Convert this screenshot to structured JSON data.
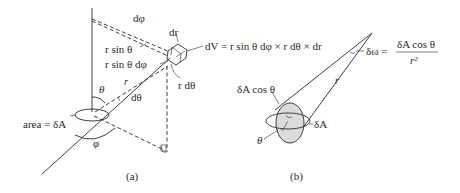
{
  "figure": {
    "panel_a": {
      "caption": "(a)",
      "labels": {
        "d_phi": "dφ",
        "dr": "dr",
        "r_sin_theta": "r sin θ",
        "r_sin_theta_dphi": "r sin θ dφ",
        "dV_formula": "dV = r sin θ dφ × r dθ × dr",
        "r_dtheta": "r dθ",
        "r": "r",
        "theta": "θ",
        "d_theta": "dθ",
        "area": "area = δA",
        "phi": "φ"
      }
    },
    "panel_b": {
      "caption": "(b)",
      "labels": {
        "delta_omega": "δω =",
        "numerator": "δA cos θ",
        "denominator": "r²",
        "dA_cos_theta": "δA cos θ",
        "r": "r",
        "delta_A": "δA",
        "theta": "θ"
      }
    }
  }
}
